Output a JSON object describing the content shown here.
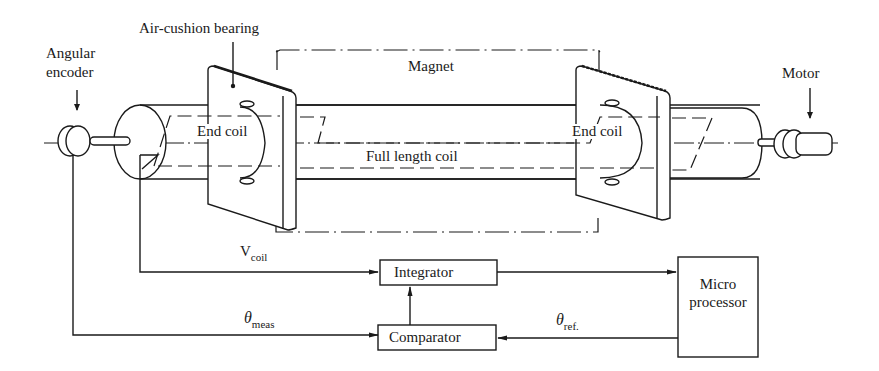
{
  "diagram": {
    "components": {
      "angular_encoder": {
        "label_line1": "Angular",
        "label_line2": "encoder"
      },
      "air_cushion_bearing": {
        "label": "Air-cushion bearing"
      },
      "magnet": {
        "label": "Magnet"
      },
      "motor": {
        "label": "Motor"
      },
      "end_coil_left": {
        "label": "End coil"
      },
      "end_coil_right": {
        "label": "End coil"
      },
      "full_length_coil": {
        "label": "Full length coil"
      }
    },
    "blocks": {
      "integrator": {
        "label": "Integrator"
      },
      "comparator": {
        "label": "Comparator"
      },
      "microprocessor": {
        "label_line1": "Micro",
        "label_line2": "processor"
      }
    },
    "signals": {
      "v_coil": {
        "main": "V",
        "sub": "coil"
      },
      "theta_meas": {
        "main": "θ",
        "sub": "meas"
      },
      "theta_ref": {
        "main": "θ",
        "sub": "ref."
      }
    },
    "connections": [
      {
        "from": "end_coil_left",
        "to": "integrator",
        "signal": "V_coil"
      },
      {
        "from": "angular_encoder",
        "to": "comparator",
        "signal": "θ_meas"
      },
      {
        "from": "microprocessor",
        "to": "comparator",
        "signal": "θ_ref."
      },
      {
        "from": "comparator",
        "to": "integrator"
      },
      {
        "from": "integrator",
        "to": "microprocessor"
      }
    ]
  }
}
